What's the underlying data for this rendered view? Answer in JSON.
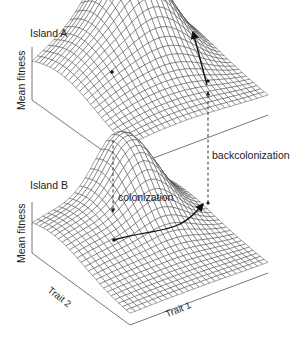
{
  "figure": {
    "panels": [
      {
        "title": "Island A",
        "z_axis_label": "Mean fitness",
        "description": "Fitness landscape with a local low peak on the left and a high peak on the right"
      },
      {
        "title": "Island B",
        "z_axis_label": "Mean fitness",
        "x_axis_label": "Trait 1",
        "y_axis_label": "Trait 2",
        "description": "Fitness landscape with a broad ridge and a single peak on the right"
      }
    ],
    "annotations": {
      "colonization": "colonization",
      "backcolonization": "backcolonization"
    },
    "colors": {
      "mesh": "#3a3a3a",
      "axis": "#555555",
      "arrow": "#111111",
      "background": "#ffffff"
    }
  }
}
